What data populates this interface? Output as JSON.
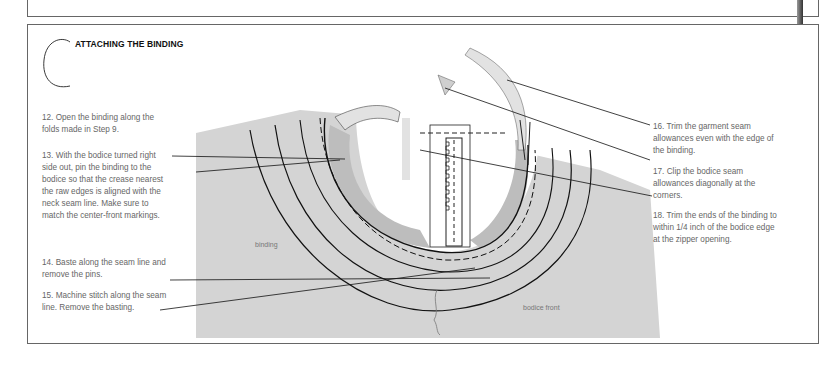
{
  "section": {
    "letter": "C",
    "title": "ATTACHING THE BINDING"
  },
  "steps_left": [
    {
      "number": "12",
      "text": "12. Open the binding along the folds made in Step 9."
    },
    {
      "number": "13",
      "text": "13. With the bodice turned right side out, pin the binding to the bodice so that the crease nearest the raw edges is aligned with the neck seam line. Make sure to match the center-front markings."
    },
    {
      "number": "14",
      "text": "14. Baste along the seam line and remove the pins."
    },
    {
      "number": "15",
      "text": "15. Machine stitch along the seam line. Remove the basting."
    }
  ],
  "steps_right": [
    {
      "number": "16",
      "text": "16. Trim the garment seam allowances even with the edge of the binding."
    },
    {
      "number": "17",
      "text": "17. Clip the bodice seam allowances diagonally at the corners."
    },
    {
      "number": "18",
      "text": "18. Trim the ends of the binding to within 1/4 inch of the bodice edge at the zipper opening."
    }
  ],
  "illustration": {
    "labels": {
      "binding": "binding",
      "bodice_front": "bodice front"
    },
    "colors": {
      "fabric": "#d4d4d4",
      "fabric_dark": "#bdbdbd",
      "binding_light": "#e2e2e2",
      "line": "#111111"
    }
  }
}
